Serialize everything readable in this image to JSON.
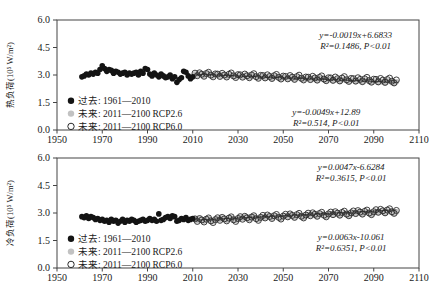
{
  "header": {
    "clipped_caption": "·· ····· ···· ·· ······· ····"
  },
  "legend": {
    "items": [
      {
        "style": "filled",
        "color": "#141414",
        "label": "过去: 1961—2010"
      },
      {
        "style": "filled",
        "color": "#c2c2c2",
        "label": "未来: 2011—2100 RCP2.6"
      },
      {
        "style": "open",
        "color": "#2b2b2b",
        "label": "未来: 2011—2100 RCP6.0"
      }
    ]
  },
  "chart_data": [
    {
      "id": "heat-load",
      "type": "scatter",
      "title": "",
      "xlabel": "",
      "ylabel": "热负荷(10⁵ W/m²)",
      "xlim": [
        1950,
        2110
      ],
      "ylim": [
        0,
        6
      ],
      "xticks": [
        1950,
        1970,
        1990,
        2010,
        2030,
        2050,
        2070,
        2090,
        2110
      ],
      "ytick_labels": [
        "0.0",
        "1.5",
        "3.0",
        "4.5",
        "6.0"
      ],
      "grid": false,
      "legend_position": "bottom-left-inside",
      "series": [
        {
          "name": "过去: 1961—2010",
          "marker": "filled",
          "color": "#141414",
          "radius": 2.8,
          "x_start": 1961,
          "values": [
            2.9,
            2.95,
            3.05,
            3.0,
            3.1,
            3.05,
            3.15,
            3.1,
            3.3,
            3.5,
            3.35,
            3.2,
            3.3,
            3.25,
            3.1,
            3.2,
            3.15,
            3.05,
            3.1,
            3.15,
            3.0,
            3.1,
            3.05,
            3.1,
            3.15,
            3.0,
            3.2,
            3.1,
            3.35,
            3.3,
            3.05,
            2.95,
            3.1,
            3.0,
            2.9,
            3.05,
            2.95,
            2.85,
            2.9,
            3.0,
            2.8,
            2.9,
            2.6,
            2.75,
            2.85,
            3.2,
            3.15,
            2.95,
            2.8,
            2.9
          ]
        },
        {
          "name": "未来: 2011—2100 RCP2.6",
          "marker": "filled",
          "color": "#c2c2c2",
          "radius": 2.8,
          "x_start": 2011,
          "values": [
            3.05,
            2.98,
            3.08,
            3.02,
            2.95,
            3.04,
            3.09,
            2.99,
            2.94,
            3.03,
            3.0,
            2.93,
            3.03,
            2.97,
            2.9,
            2.99,
            3.04,
            2.94,
            2.89,
            2.98,
            2.95,
            2.88,
            2.98,
            2.92,
            2.85,
            2.94,
            2.99,
            2.89,
            2.84,
            2.93,
            2.9,
            2.83,
            2.93,
            2.87,
            2.8,
            2.89,
            2.94,
            2.84,
            2.79,
            2.88,
            2.85,
            2.78,
            2.88,
            2.82,
            2.75,
            2.84,
            2.89,
            2.79,
            2.74,
            2.83,
            2.8,
            2.73,
            2.83,
            2.77,
            2.7,
            2.79,
            2.84,
            2.74,
            2.69,
            2.78,
            2.75,
            2.68,
            2.78,
            2.72,
            2.65,
            2.74,
            2.79,
            2.69,
            2.64,
            2.73,
            2.7,
            2.63,
            2.73,
            2.67,
            2.6,
            2.69,
            2.74,
            2.64,
            2.59,
            2.68,
            2.65,
            2.58,
            2.68,
            2.62,
            2.55,
            2.64,
            2.69,
            2.59,
            2.54,
            2.63
          ]
        },
        {
          "name": "未来: 2011—2100 RCP6.0",
          "marker": "open",
          "color": "#2b2b2b",
          "radius": 3.0,
          "x_start": 2011,
          "values": [
            3.1,
            2.96,
            3.12,
            3.04,
            2.93,
            3.08,
            3.15,
            2.99,
            2.9,
            3.06,
            3.05,
            2.92,
            3.09,
            3.0,
            2.89,
            3.04,
            3.11,
            2.95,
            2.86,
            3.02,
            3.01,
            2.88,
            3.05,
            2.96,
            2.85,
            3.0,
            3.07,
            2.91,
            2.82,
            2.98,
            2.97,
            2.84,
            3.01,
            2.92,
            2.81,
            2.96,
            3.03,
            2.87,
            2.78,
            2.94,
            2.92,
            2.79,
            2.97,
            2.88,
            2.76,
            2.91,
            2.99,
            2.82,
            2.73,
            2.89,
            2.88,
            2.75,
            2.93,
            2.84,
            2.72,
            2.87,
            2.95,
            2.78,
            2.69,
            2.85,
            2.84,
            2.71,
            2.89,
            2.8,
            2.68,
            2.83,
            2.91,
            2.74,
            2.65,
            2.81,
            2.8,
            2.67,
            2.85,
            2.76,
            2.64,
            2.79,
            2.87,
            2.7,
            2.61,
            2.77,
            2.76,
            2.63,
            2.81,
            2.72,
            2.6,
            2.75,
            2.83,
            2.66,
            2.57,
            2.73
          ]
        }
      ],
      "trendline": {
        "x1": 2011,
        "y1": 3.04,
        "x2": 2100,
        "y2": 2.6,
        "color": "#3a3a3a"
      },
      "annotations": [
        {
          "lines": [
            "y=-0.0019x+6.6833",
            "R²=0.1486, P<0.01"
          ],
          "ax": 2082,
          "ay": 5.0
        },
        {
          "lines": [
            "y=-0.0049x+12.89",
            "R²=0.514, P<0.01"
          ],
          "ax": 2069,
          "ay": 0.82
        }
      ]
    },
    {
      "id": "cold-load",
      "type": "scatter",
      "title": "",
      "xlabel": "",
      "ylabel": "冷负荷(10⁵ W/m²)",
      "xlim": [
        1950,
        2110
      ],
      "ylim": [
        0,
        6
      ],
      "xticks": [
        1950,
        1970,
        1990,
        2010,
        2030,
        2050,
        2070,
        2090,
        2110
      ],
      "ytick_labels": [
        "0.0",
        "1.5",
        "3.0",
        "4.5",
        "6.0"
      ],
      "grid": false,
      "legend_position": "bottom-left-inside",
      "series": [
        {
          "name": "过去: 1961—2010",
          "marker": "filled",
          "color": "#141414",
          "radius": 2.8,
          "x_start": 1961,
          "values": [
            2.8,
            2.75,
            2.85,
            2.7,
            2.8,
            2.75,
            2.65,
            2.7,
            2.6,
            2.65,
            2.55,
            2.6,
            2.5,
            2.65,
            2.55,
            2.6,
            2.45,
            2.55,
            2.65,
            2.5,
            2.6,
            2.55,
            2.65,
            2.6,
            2.5,
            2.55,
            2.6,
            2.65,
            2.55,
            2.6,
            2.7,
            2.6,
            2.65,
            2.55,
            2.95,
            2.6,
            2.65,
            2.75,
            2.8,
            2.7,
            2.85,
            2.8,
            2.55,
            2.6,
            2.7,
            2.65,
            2.75,
            2.6,
            2.65,
            2.7
          ]
        },
        {
          "name": "未来: 2011—2100 RCP2.6",
          "marker": "filled",
          "color": "#c2c2c2",
          "radius": 2.8,
          "x_start": 2011,
          "values": [
            2.65,
            2.58,
            2.68,
            2.62,
            2.55,
            2.64,
            2.69,
            2.59,
            2.54,
            2.63,
            2.7,
            2.63,
            2.73,
            2.67,
            2.6,
            2.69,
            2.74,
            2.64,
            2.59,
            2.68,
            2.76,
            2.69,
            2.79,
            2.73,
            2.66,
            2.75,
            2.8,
            2.7,
            2.65,
            2.74,
            2.81,
            2.74,
            2.84,
            2.78,
            2.71,
            2.8,
            2.85,
            2.75,
            2.7,
            2.79,
            2.86,
            2.79,
            2.89,
            2.83,
            2.76,
            2.85,
            2.9,
            2.8,
            2.75,
            2.84,
            2.92,
            2.85,
            2.95,
            2.89,
            2.82,
            2.91,
            2.96,
            2.86,
            2.81,
            2.9,
            2.97,
            2.9,
            3.0,
            2.94,
            2.87,
            2.96,
            3.01,
            2.91,
            2.86,
            2.95,
            3.02,
            2.95,
            3.05,
            2.99,
            2.92,
            3.01,
            3.06,
            2.96,
            2.91,
            3.0,
            3.08,
            3.01,
            3.11,
            3.05,
            2.98,
            3.07,
            3.12,
            3.02,
            2.97,
            3.06
          ]
        },
        {
          "name": "未来: 2011—2100 RCP6.0",
          "marker": "open",
          "color": "#2b2b2b",
          "radius": 3.0,
          "x_start": 2011,
          "values": [
            2.68,
            2.54,
            2.7,
            2.62,
            2.51,
            2.66,
            2.73,
            2.57,
            2.48,
            2.64,
            2.74,
            2.6,
            2.76,
            2.68,
            2.57,
            2.72,
            2.79,
            2.63,
            2.54,
            2.7,
            2.8,
            2.66,
            2.82,
            2.74,
            2.63,
            2.78,
            2.85,
            2.69,
            2.6,
            2.76,
            2.87,
            2.73,
            2.89,
            2.81,
            2.7,
            2.85,
            2.92,
            2.76,
            2.67,
            2.83,
            2.93,
            2.79,
            2.95,
            2.87,
            2.76,
            2.91,
            2.98,
            2.82,
            2.73,
            2.89,
            2.99,
            2.85,
            3.01,
            2.93,
            2.82,
            2.97,
            3.04,
            2.88,
            2.79,
            2.95,
            3.05,
            2.91,
            3.07,
            2.99,
            2.88,
            3.03,
            3.1,
            2.94,
            2.85,
            3.01,
            3.11,
            2.97,
            3.13,
            3.05,
            2.94,
            3.09,
            3.16,
            3.0,
            2.91,
            3.07,
            3.18,
            3.04,
            3.2,
            3.12,
            3.01,
            3.16,
            3.23,
            3.07,
            2.98,
            3.14
          ]
        }
      ],
      "trendline": {
        "x1": 2011,
        "y1": 2.61,
        "x2": 2100,
        "y2": 3.17,
        "color": "#3a3a3a"
      },
      "annotations": [
        {
          "lines": [
            "y=0.0047x-6.6284",
            "R²=0.3615, P<0.01"
          ],
          "ax": 2080,
          "ay": 5.35
        },
        {
          "lines": [
            "y=0.0063x-10.061",
            "R²=0.6351, P<0.01"
          ],
          "ax": 2080,
          "ay": 1.53
        }
      ]
    }
  ]
}
